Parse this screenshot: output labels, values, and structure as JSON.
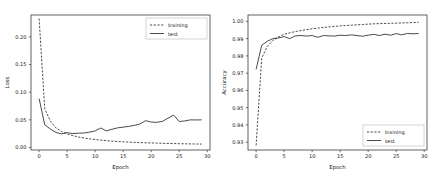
{
  "figure": {
    "background": "#ffffff",
    "line_color": "#2b2b2b",
    "axis_color": "#3a3a3a"
  },
  "chart_data": [
    {
      "type": "line",
      "title": "",
      "xlabel": "Epoch",
      "ylabel": "Loss",
      "xlim": [
        -1.45,
        30.5
      ],
      "ylim": [
        -0.0045,
        0.2395
      ],
      "xticks": [
        0,
        5,
        10,
        15,
        20,
        25,
        30
      ],
      "xticklabels": [
        "0",
        "5",
        "10",
        "15",
        "20",
        "25",
        "30"
      ],
      "yticks": [
        0.0,
        0.05,
        0.1,
        0.15,
        0.2
      ],
      "yticklabels": [
        "0.00",
        "0.05",
        "0.10",
        "0.15",
        "0.20"
      ],
      "grid": false,
      "legend_position": "upper right",
      "x": [
        0,
        1,
        2,
        3,
        4,
        5,
        6,
        7,
        8,
        9,
        10,
        11,
        12,
        13,
        14,
        15,
        16,
        17,
        18,
        19,
        20,
        21,
        22,
        23,
        24,
        25,
        26,
        27,
        28,
        29
      ],
      "series": [
        {
          "name": "training",
          "style": "dashed",
          "values": [
            0.233,
            0.07,
            0.048,
            0.0355,
            0.029,
            0.0245,
            0.0215,
            0.019,
            0.0172,
            0.0157,
            0.0145,
            0.0133,
            0.0124,
            0.0116,
            0.0109,
            0.0103,
            0.0098,
            0.0093,
            0.0089,
            0.0085,
            0.0082,
            0.0079,
            0.0076,
            0.0073,
            0.0071,
            0.0069,
            0.0067,
            0.0065,
            0.0063,
            0.0062
          ]
        },
        {
          "name": "test",
          "style": "solid",
          "values": [
            0.0885,
            0.041,
            0.0335,
            0.0272,
            0.0248,
            0.0268,
            0.0252,
            0.0258,
            0.0262,
            0.0278,
            0.03,
            0.0352,
            0.03,
            0.033,
            0.0355,
            0.0368,
            0.0382,
            0.04,
            0.0425,
            0.0485,
            0.046,
            0.0455,
            0.0472,
            0.053,
            0.0585,
            0.047,
            0.048,
            0.05,
            0.0498,
            0.05
          ]
        }
      ],
      "legend": [
        "training",
        "test"
      ]
    },
    {
      "type": "line",
      "title": "",
      "xlabel": "Epoch",
      "ylabel": "Accuracy",
      "xlim": [
        -1.45,
        30.5
      ],
      "ylim": [
        0.9255,
        1.0037
      ],
      "xticks": [
        0,
        5,
        10,
        15,
        20,
        25,
        30
      ],
      "xticklabels": [
        "0",
        "5",
        "10",
        "15",
        "20",
        "25",
        "30"
      ],
      "yticks": [
        0.93,
        0.94,
        0.95,
        0.96,
        0.97,
        0.98,
        0.99,
        1.0
      ],
      "yticklabels": [
        "0.93",
        "0.94",
        "0.95",
        "0.96",
        "0.97",
        "0.98",
        "0.99",
        "1.00"
      ],
      "grid": false,
      "legend_position": "lower right",
      "x": [
        0,
        1,
        2,
        3,
        4,
        5,
        6,
        7,
        8,
        9,
        10,
        11,
        12,
        13,
        14,
        15,
        16,
        17,
        18,
        19,
        20,
        21,
        22,
        23,
        24,
        25,
        26,
        27,
        28,
        29
      ],
      "series": [
        {
          "name": "training",
          "style": "dashed",
          "values": [
            0.9282,
            0.9788,
            0.9855,
            0.989,
            0.991,
            0.9925,
            0.9934,
            0.9941,
            0.9947,
            0.9952,
            0.9957,
            0.9961,
            0.9965,
            0.9968,
            0.9971,
            0.9974,
            0.9976,
            0.9978,
            0.998,
            0.9982,
            0.9984,
            0.9986,
            0.9987,
            0.9988,
            0.9989,
            0.999,
            0.9991,
            0.9992,
            0.9993,
            0.9995
          ]
        },
        {
          "name": "test",
          "style": "solid",
          "values": [
            0.9722,
            0.9862,
            0.9885,
            0.99,
            0.9904,
            0.9912,
            0.99,
            0.9916,
            0.9918,
            0.9915,
            0.9918,
            0.9908,
            0.9918,
            0.9916,
            0.9915,
            0.992,
            0.9918,
            0.9922,
            0.9918,
            0.9914,
            0.992,
            0.9925,
            0.9918,
            0.9926,
            0.992,
            0.9929,
            0.9922,
            0.993,
            0.9928,
            0.993
          ]
        }
      ],
      "legend": [
        "training",
        "test"
      ]
    }
  ]
}
